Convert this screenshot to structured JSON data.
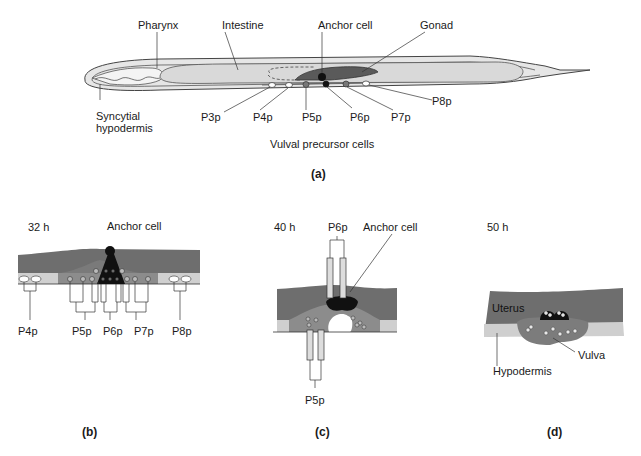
{
  "figure": {
    "colors": {
      "dark_tissue": "#6e6e6e",
      "mid_tissue": "#8c8c8c",
      "light_tissue": "#d4d4d4",
      "hypodermis_light": "#c8c8c8",
      "anchor_cell": "#111111",
      "outline": "#333333",
      "worm_fill": "#e2e2e2"
    },
    "panel_a": {
      "label": "(a)",
      "structures": {
        "pharynx": "Pharynx",
        "intestine": "Intestine",
        "anchor_cell": "Anchor cell",
        "gonad": "Gonad",
        "syncytial_hypodermis_line1": "Syncytial",
        "syncytial_hypodermis_line2": "hypodermis"
      },
      "cells": [
        "P3p",
        "P4p",
        "P5p",
        "P6p",
        "P7p",
        "P8p"
      ],
      "caption": "Vulval precursor cells"
    },
    "panel_b": {
      "label": "(b)",
      "time": "32 h",
      "anchor_cell": "Anchor cell",
      "lineages": [
        "P4p",
        "P5p",
        "P6p",
        "P7p",
        "P8p"
      ]
    },
    "panel_c": {
      "label": "(c)",
      "time": "40 h",
      "top_lineage": "P6p",
      "anchor_cell": "Anchor cell",
      "bottom_lineage": "P5p"
    },
    "panel_d": {
      "label": "(d)",
      "time": "50 h",
      "uterus": "Uterus",
      "vulva": "Vulva",
      "hypodermis": "Hypodermis"
    }
  }
}
